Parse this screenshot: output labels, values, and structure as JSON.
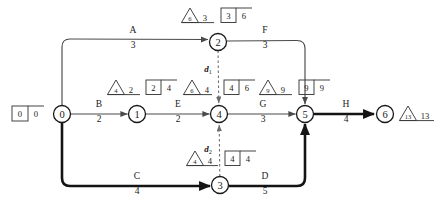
{
  "diagram": {
    "type": "activity-on-arrow-network",
    "title": "",
    "nodes": [
      {
        "id": "n0",
        "label": "0",
        "cx": 62,
        "cy": 114,
        "r": 8.5
      },
      {
        "id": "n1",
        "label": "1",
        "cx": 137,
        "cy": 114,
        "r": 8.5
      },
      {
        "id": "n2",
        "label": "2",
        "cx": 218,
        "cy": 42,
        "r": 8.5
      },
      {
        "id": "n3",
        "label": "3",
        "cx": 220,
        "cy": 185,
        "r": 8.5
      },
      {
        "id": "n4",
        "label": "4",
        "cx": 219,
        "cy": 114,
        "r": 8.5
      },
      {
        "id": "n5",
        "label": "5",
        "cx": 305,
        "cy": 114,
        "r": 8.5
      },
      {
        "id": "n6",
        "label": "6",
        "cx": 385,
        "cy": 114,
        "r": 8.5
      }
    ],
    "edges": [
      {
        "id": "A",
        "name": "A",
        "duration": "3",
        "from": "0",
        "to": "2",
        "critical": false,
        "label_x": 133,
        "label_name_y": 33,
        "label_dur_y": 48
      },
      {
        "id": "B",
        "name": "B",
        "duration": "2",
        "from": "0",
        "to": "1",
        "critical": false,
        "label_x": 99,
        "label_name_y": 107,
        "label_dur_y": 122
      },
      {
        "id": "C",
        "name": "C",
        "duration": "4",
        "from": "0",
        "to": "3",
        "critical": true,
        "label_x": 137,
        "label_name_y": 179,
        "label_dur_y": 194
      },
      {
        "id": "E",
        "name": "E",
        "duration": "2",
        "from": "1",
        "to": "4",
        "critical": false,
        "label_x": 178,
        "label_name_y": 107,
        "label_dur_y": 122
      },
      {
        "id": "F",
        "name": "F",
        "duration": "3",
        "from": "2",
        "to": "5",
        "critical": false,
        "label_x": 265,
        "label_name_y": 33,
        "label_dur_y": 48
      },
      {
        "id": "G",
        "name": "G",
        "duration": "3",
        "from": "4",
        "to": "5",
        "critical": false,
        "label_x": 263,
        "label_name_y": 107,
        "label_dur_y": 122
      },
      {
        "id": "D",
        "name": "D",
        "duration": "5",
        "from": "3",
        "to": "5",
        "critical": true,
        "label_x": 265,
        "label_name_y": 179,
        "label_dur_y": 194
      },
      {
        "id": "H",
        "name": "H",
        "duration": "4",
        "from": "5",
        "to": "6",
        "critical": true,
        "label_x": 346,
        "label_name_y": 107,
        "label_dur_y": 122
      }
    ],
    "dummy_edges": [
      {
        "id": "d1",
        "name": "d",
        "subscript": "1",
        "from": "2",
        "to": "4",
        "label_x": 208,
        "label_y": 72
      },
      {
        "id": "d2",
        "name": "d",
        "subscript": "2",
        "from": "3",
        "to": "4",
        "label_x": 208,
        "label_y": 152
      }
    ],
    "node_annotations": [
      {
        "node": "0",
        "has_triangle": false,
        "triangle_inner": "",
        "triangle_value": "",
        "has_box": true,
        "box_left": "0",
        "box_right": "0",
        "box_x": 12,
        "box_y": 106
      },
      {
        "node": "1",
        "has_triangle": true,
        "triangle_inner": "4",
        "triangle_value": "2",
        "triangle_x": 107,
        "triangle_y": 80,
        "has_box": true,
        "box_left": "2",
        "box_right": "4",
        "box_x": 146,
        "box_y": 80
      },
      {
        "node": "2",
        "has_triangle": true,
        "triangle_inner": "6",
        "triangle_value": "3",
        "triangle_x": 181,
        "triangle_y": 8,
        "has_box": true,
        "box_left": "3",
        "box_right": "6",
        "box_x": 221,
        "box_y": 8
      },
      {
        "node": "3",
        "has_triangle": true,
        "triangle_inner": "4",
        "triangle_value": "4",
        "triangle_x": 186,
        "triangle_y": 151,
        "has_box": true,
        "box_left": "4",
        "box_right": "4",
        "box_x": 225,
        "box_y": 151
      },
      {
        "node": "4",
        "has_triangle": true,
        "triangle_inner": "6",
        "triangle_value": "4",
        "triangle_x": 183,
        "triangle_y": 80,
        "has_box": true,
        "box_left": "4",
        "box_right": "6",
        "box_x": 221,
        "box_y": 80
      },
      {
        "node": "5",
        "has_triangle": true,
        "triangle_inner": "9",
        "triangle_value": "9",
        "triangle_x": 259,
        "triangle_y": 80,
        "has_box": true,
        "box_left": "9",
        "box_right": "9",
        "box_x": 299,
        "box_y": 80
      },
      {
        "node": "6",
        "has_triangle": true,
        "triangle_inner": "13",
        "triangle_value": "13",
        "triangle_x": 399,
        "triangle_y": 106,
        "has_box": false,
        "box_left": "",
        "box_right": "",
        "box_x": 0,
        "box_y": 0
      }
    ],
    "colors": {
      "stroke": "#4a4a4a",
      "critical_stroke": "#141414",
      "node_stroke": "#1a1a1a",
      "text": "#1a1a1a",
      "background": "#ffffff"
    }
  }
}
